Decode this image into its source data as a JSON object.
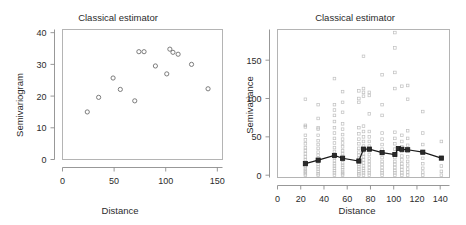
{
  "figure": {
    "width": 466,
    "height": 225,
    "background": "#ffffff",
    "panel_count": 2
  },
  "chart_data": [
    {
      "id": "left-panel",
      "type": "scatter",
      "title": "Classical estimator",
      "xlabel": "Distance",
      "ylabel": "Semivariogram",
      "xlim": [
        0,
        155
      ],
      "ylim": [
        0,
        41
      ],
      "xticks": [
        0,
        50,
        100,
        150
      ],
      "yticks": [
        0,
        10,
        20,
        30,
        40
      ],
      "grid": false,
      "legend": "none",
      "marker": "open-circle",
      "marker_color": "#6e6e6e",
      "points": [
        {
          "x": 24,
          "y": 15.0
        },
        {
          "x": 35,
          "y": 19.6
        },
        {
          "x": 49,
          "y": 25.7
        },
        {
          "x": 56,
          "y": 22.1
        },
        {
          "x": 70,
          "y": 18.5
        },
        {
          "x": 74,
          "y": 34.0
        },
        {
          "x": 79,
          "y": 34.0
        },
        {
          "x": 90,
          "y": 29.5
        },
        {
          "x": 101,
          "y": 27.0
        },
        {
          "x": 104,
          "y": 34.8
        },
        {
          "x": 107,
          "y": 33.8
        },
        {
          "x": 112,
          "y": 33.2
        },
        {
          "x": 125,
          "y": 30.0
        },
        {
          "x": 141,
          "y": 22.3
        }
      ]
    },
    {
      "id": "right-panel",
      "type": "scatter",
      "title": "Classical estimator",
      "xlabel": "Distance",
      "ylabel": "Semivariance",
      "xlim": [
        0,
        148
      ],
      "ylim": [
        -3,
        190
      ],
      "xticks": [
        0,
        20,
        40,
        60,
        80,
        100,
        120,
        140
      ],
      "yticks": [
        0,
        50,
        100,
        150
      ],
      "grid": false,
      "legend": "none",
      "series": [
        {
          "name": "individual-semivariances",
          "marker": "open-square",
          "marker_color": "#bfbfbf",
          "points": [
            {
              "x": 24,
              "y": 0
            },
            {
              "x": 24,
              "y": 2
            },
            {
              "x": 24,
              "y": 4
            },
            {
              "x": 24,
              "y": 6
            },
            {
              "x": 24,
              "y": 8
            },
            {
              "x": 24,
              "y": 11
            },
            {
              "x": 24,
              "y": 14
            },
            {
              "x": 24,
              "y": 17
            },
            {
              "x": 24,
              "y": 20
            },
            {
              "x": 24,
              "y": 24
            },
            {
              "x": 24,
              "y": 28
            },
            {
              "x": 24,
              "y": 32
            },
            {
              "x": 24,
              "y": 36
            },
            {
              "x": 24,
              "y": 41
            },
            {
              "x": 24,
              "y": 46
            },
            {
              "x": 24,
              "y": 52
            },
            {
              "x": 24,
              "y": 63
            },
            {
              "x": 24,
              "y": 65
            },
            {
              "x": 24,
              "y": 99
            },
            {
              "x": 35,
              "y": 0
            },
            {
              "x": 35,
              "y": 2
            },
            {
              "x": 35,
              "y": 5
            },
            {
              "x": 35,
              "y": 8
            },
            {
              "x": 35,
              "y": 11
            },
            {
              "x": 35,
              "y": 14
            },
            {
              "x": 35,
              "y": 18
            },
            {
              "x": 35,
              "y": 22
            },
            {
              "x": 35,
              "y": 26
            },
            {
              "x": 35,
              "y": 30
            },
            {
              "x": 35,
              "y": 35
            },
            {
              "x": 35,
              "y": 40
            },
            {
              "x": 35,
              "y": 45
            },
            {
              "x": 35,
              "y": 52
            },
            {
              "x": 35,
              "y": 60
            },
            {
              "x": 35,
              "y": 62
            },
            {
              "x": 35,
              "y": 74
            },
            {
              "x": 35,
              "y": 92
            },
            {
              "x": 49,
              "y": 0
            },
            {
              "x": 49,
              "y": 3
            },
            {
              "x": 49,
              "y": 6
            },
            {
              "x": 49,
              "y": 9
            },
            {
              "x": 49,
              "y": 12
            },
            {
              "x": 49,
              "y": 15
            },
            {
              "x": 49,
              "y": 19
            },
            {
              "x": 49,
              "y": 23
            },
            {
              "x": 49,
              "y": 27
            },
            {
              "x": 49,
              "y": 31
            },
            {
              "x": 49,
              "y": 36
            },
            {
              "x": 49,
              "y": 42
            },
            {
              "x": 49,
              "y": 48
            },
            {
              "x": 49,
              "y": 55
            },
            {
              "x": 49,
              "y": 62
            },
            {
              "x": 49,
              "y": 70
            },
            {
              "x": 49,
              "y": 78
            },
            {
              "x": 49,
              "y": 85
            },
            {
              "x": 49,
              "y": 92
            },
            {
              "x": 49,
              "y": 126
            },
            {
              "x": 56,
              "y": 0
            },
            {
              "x": 56,
              "y": 2
            },
            {
              "x": 56,
              "y": 4
            },
            {
              "x": 56,
              "y": 7
            },
            {
              "x": 56,
              "y": 10
            },
            {
              "x": 56,
              "y": 13
            },
            {
              "x": 56,
              "y": 16
            },
            {
              "x": 56,
              "y": 20
            },
            {
              "x": 56,
              "y": 24
            },
            {
              "x": 56,
              "y": 28
            },
            {
              "x": 56,
              "y": 32
            },
            {
              "x": 56,
              "y": 37
            },
            {
              "x": 56,
              "y": 42
            },
            {
              "x": 56,
              "y": 47
            },
            {
              "x": 56,
              "y": 53
            },
            {
              "x": 56,
              "y": 60
            },
            {
              "x": 56,
              "y": 67
            },
            {
              "x": 56,
              "y": 82
            },
            {
              "x": 56,
              "y": 95
            },
            {
              "x": 56,
              "y": 109
            },
            {
              "x": 70,
              "y": 0
            },
            {
              "x": 70,
              "y": 2
            },
            {
              "x": 70,
              "y": 5
            },
            {
              "x": 70,
              "y": 8
            },
            {
              "x": 70,
              "y": 11
            },
            {
              "x": 70,
              "y": 14
            },
            {
              "x": 70,
              "y": 18
            },
            {
              "x": 70,
              "y": 22
            },
            {
              "x": 70,
              "y": 26
            },
            {
              "x": 70,
              "y": 30
            },
            {
              "x": 70,
              "y": 35
            },
            {
              "x": 70,
              "y": 41
            },
            {
              "x": 70,
              "y": 47
            },
            {
              "x": 70,
              "y": 54
            },
            {
              "x": 70,
              "y": 62
            },
            {
              "x": 70,
              "y": 95
            },
            {
              "x": 70,
              "y": 100
            },
            {
              "x": 70,
              "y": 110
            },
            {
              "x": 74,
              "y": 0
            },
            {
              "x": 74,
              "y": 3
            },
            {
              "x": 74,
              "y": 6
            },
            {
              "x": 74,
              "y": 9
            },
            {
              "x": 74,
              "y": 12
            },
            {
              "x": 74,
              "y": 16
            },
            {
              "x": 74,
              "y": 20
            },
            {
              "x": 74,
              "y": 24
            },
            {
              "x": 74,
              "y": 28
            },
            {
              "x": 74,
              "y": 33
            },
            {
              "x": 74,
              "y": 38
            },
            {
              "x": 74,
              "y": 44
            },
            {
              "x": 74,
              "y": 50
            },
            {
              "x": 74,
              "y": 57
            },
            {
              "x": 74,
              "y": 64
            },
            {
              "x": 74,
              "y": 103
            },
            {
              "x": 74,
              "y": 108
            },
            {
              "x": 74,
              "y": 113
            },
            {
              "x": 74,
              "y": 155
            },
            {
              "x": 79,
              "y": 0
            },
            {
              "x": 79,
              "y": 3
            },
            {
              "x": 79,
              "y": 6
            },
            {
              "x": 79,
              "y": 10
            },
            {
              "x": 79,
              "y": 14
            },
            {
              "x": 79,
              "y": 18
            },
            {
              "x": 79,
              "y": 22
            },
            {
              "x": 79,
              "y": 27
            },
            {
              "x": 79,
              "y": 32
            },
            {
              "x": 79,
              "y": 38
            },
            {
              "x": 79,
              "y": 44
            },
            {
              "x": 79,
              "y": 50
            },
            {
              "x": 79,
              "y": 57
            },
            {
              "x": 79,
              "y": 80
            },
            {
              "x": 79,
              "y": 104
            },
            {
              "x": 79,
              "y": 108
            },
            {
              "x": 90,
              "y": 0
            },
            {
              "x": 90,
              "y": 3
            },
            {
              "x": 90,
              "y": 6
            },
            {
              "x": 90,
              "y": 10
            },
            {
              "x": 90,
              "y": 14
            },
            {
              "x": 90,
              "y": 18
            },
            {
              "x": 90,
              "y": 23
            },
            {
              "x": 90,
              "y": 28
            },
            {
              "x": 90,
              "y": 34
            },
            {
              "x": 90,
              "y": 40
            },
            {
              "x": 90,
              "y": 47
            },
            {
              "x": 90,
              "y": 55
            },
            {
              "x": 90,
              "y": 78
            },
            {
              "x": 90,
              "y": 92
            },
            {
              "x": 90,
              "y": 131
            },
            {
              "x": 101,
              "y": 0
            },
            {
              "x": 101,
              "y": 3
            },
            {
              "x": 101,
              "y": 6
            },
            {
              "x": 101,
              "y": 10
            },
            {
              "x": 101,
              "y": 14
            },
            {
              "x": 101,
              "y": 18
            },
            {
              "x": 101,
              "y": 23
            },
            {
              "x": 101,
              "y": 28
            },
            {
              "x": 101,
              "y": 34
            },
            {
              "x": 101,
              "y": 41
            },
            {
              "x": 101,
              "y": 48
            },
            {
              "x": 101,
              "y": 56
            },
            {
              "x": 101,
              "y": 113
            },
            {
              "x": 101,
              "y": 134
            },
            {
              "x": 101,
              "y": 166
            },
            {
              "x": 101,
              "y": 186
            },
            {
              "x": 107,
              "y": 0
            },
            {
              "x": 107,
              "y": 3
            },
            {
              "x": 107,
              "y": 7
            },
            {
              "x": 107,
              "y": 11
            },
            {
              "x": 107,
              "y": 15
            },
            {
              "x": 107,
              "y": 20
            },
            {
              "x": 107,
              "y": 25
            },
            {
              "x": 107,
              "y": 31
            },
            {
              "x": 107,
              "y": 37
            },
            {
              "x": 107,
              "y": 44
            },
            {
              "x": 107,
              "y": 52
            },
            {
              "x": 107,
              "y": 116
            },
            {
              "x": 112,
              "y": 0
            },
            {
              "x": 112,
              "y": 4
            },
            {
              "x": 112,
              "y": 8
            },
            {
              "x": 112,
              "y": 13
            },
            {
              "x": 112,
              "y": 18
            },
            {
              "x": 112,
              "y": 24
            },
            {
              "x": 112,
              "y": 31
            },
            {
              "x": 112,
              "y": 39
            },
            {
              "x": 112,
              "y": 48
            },
            {
              "x": 112,
              "y": 58
            },
            {
              "x": 112,
              "y": 99
            },
            {
              "x": 112,
              "y": 117
            },
            {
              "x": 125,
              "y": 0
            },
            {
              "x": 125,
              "y": 4
            },
            {
              "x": 125,
              "y": 9
            },
            {
              "x": 125,
              "y": 15
            },
            {
              "x": 125,
              "y": 22
            },
            {
              "x": 125,
              "y": 30
            },
            {
              "x": 125,
              "y": 40
            },
            {
              "x": 125,
              "y": 55
            },
            {
              "x": 125,
              "y": 83
            },
            {
              "x": 141,
              "y": 0
            },
            {
              "x": 141,
              "y": 5
            },
            {
              "x": 141,
              "y": 12
            },
            {
              "x": 141,
              "y": 22
            },
            {
              "x": 141,
              "y": 44
            }
          ]
        },
        {
          "name": "classical-estimate",
          "marker": "filled-square",
          "marker_color": "#1a1a1a",
          "line": true,
          "points": [
            {
              "x": 24,
              "y": 15.0
            },
            {
              "x": 35,
              "y": 19.6
            },
            {
              "x": 49,
              "y": 25.7
            },
            {
              "x": 56,
              "y": 22.1
            },
            {
              "x": 70,
              "y": 18.5
            },
            {
              "x": 74,
              "y": 34.0
            },
            {
              "x": 79,
              "y": 34.0
            },
            {
              "x": 90,
              "y": 29.5
            },
            {
              "x": 101,
              "y": 27.0
            },
            {
              "x": 104,
              "y": 34.8
            },
            {
              "x": 107,
              "y": 33.8
            },
            {
              "x": 112,
              "y": 33.2
            },
            {
              "x": 125,
              "y": 30.0
            },
            {
              "x": 141,
              "y": 22.3
            }
          ]
        }
      ]
    }
  ]
}
